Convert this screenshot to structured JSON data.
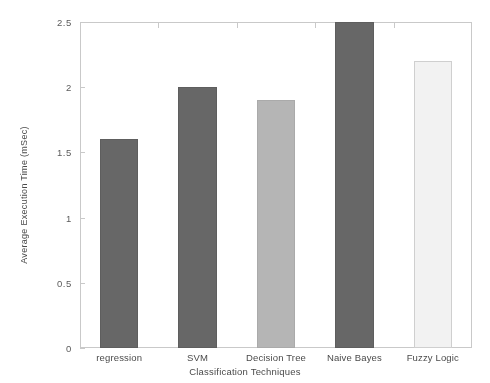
{
  "chart_data": {
    "type": "bar",
    "title": "",
    "subtitle": "",
    "categories": [
      "regression",
      "SVM",
      "Decision Tree",
      "Naive Bayes",
      "Fuzzy Logic"
    ],
    "values": [
      1.6,
      2.0,
      1.9,
      2.5,
      2.2
    ],
    "series": [
      {
        "name": "Average Execution Time (mSec)",
        "values": [
          1.6,
          2.0,
          1.9,
          2.5,
          2.2
        ]
      }
    ],
    "bar_colors": [
      "#676767",
      "#676767",
      "#b5b5b5",
      "#676767",
      "#f2f2f2"
    ],
    "bar_border_colors": [
      "#5e5e5e",
      "#5e5e5e",
      "#aaaaaa",
      "#5e5e5e",
      "#cfcfcf"
    ],
    "xlabel": "Classification Techniques",
    "ylabel": "Average Execution Time (mSec)",
    "ylim": [
      0,
      2.5
    ],
    "xlim": [
      0,
      5
    ],
    "yticks": [
      0,
      0.5,
      1,
      1.5,
      2,
      2.5
    ],
    "ytick_labels": [
      "0",
      "0.5",
      "1",
      "1.5",
      "2",
      "2.5"
    ],
    "grid": false,
    "legend": false,
    "legend_position": "none",
    "annotations": []
  },
  "axis": {
    "y_title": "Average Execution Time (mSec)",
    "x_title": "Classification Techniques"
  },
  "artifact": {
    "top_strip_text": ""
  }
}
